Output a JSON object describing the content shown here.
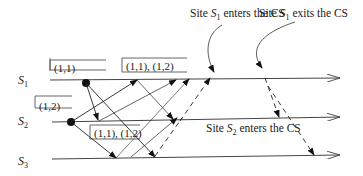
{
  "diagram": {
    "type": "distributed-mutual-exclusion-timing",
    "sites": [
      {
        "id": "S1",
        "label": "S",
        "sub": "1"
      },
      {
        "id": "S2",
        "label": "S",
        "sub": "2"
      },
      {
        "id": "S3",
        "label": "S",
        "sub": "3"
      }
    ],
    "timestamp_boxes": [
      {
        "site": "S1",
        "text": "(1,1)"
      },
      {
        "site": "S2",
        "text": "(1,2)"
      },
      {
        "site": "S1",
        "text": "(1,1), (1,2)"
      },
      {
        "site": "S2",
        "text": "(1,1), (1,2)"
      }
    ],
    "annotations": [
      {
        "prefix": "Site ",
        "site": "S",
        "sub": "1",
        "suffix": " enters the CS"
      },
      {
        "prefix": "Site ",
        "site": "S",
        "sub": "1",
        "suffix": " exits the CS"
      },
      {
        "prefix": "Site ",
        "site": "S",
        "sub": "2",
        "suffix": " enters the CS"
      }
    ],
    "messages": {
      "request": "solid arrows",
      "reply_release": "dashed arrows"
    }
  }
}
